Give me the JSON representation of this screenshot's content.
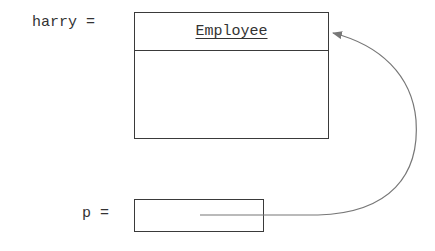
{
  "diagram": {
    "variables": [
      {
        "name": "harry",
        "label": "harry ="
      },
      {
        "name": "p",
        "label": "p ="
      }
    ],
    "object": {
      "class_name": "Employee"
    },
    "reference": {
      "from": "p",
      "to": "Employee object",
      "line_color": "#777777"
    }
  }
}
